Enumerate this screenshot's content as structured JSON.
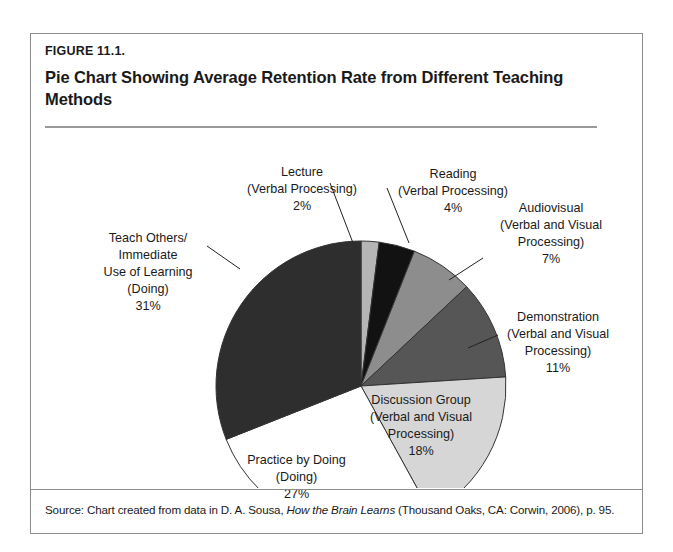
{
  "figure": {
    "label": "FIGURE 11.1.",
    "title": "Pie Chart Showing Average Retention Rate from Different Teaching Methods",
    "source_prefix": "Source: Chart created from data in D. A. Sousa, ",
    "source_book": "How the Brain Learns",
    "source_suffix": " (Thousand Oaks, CA: Corwin, 2006), p. 95."
  },
  "chart_data": {
    "type": "pie",
    "title": "Pie Chart Showing Average Retention Rate from Different Teaching Methods",
    "xlabel": "",
    "ylabel": "",
    "units": "percent",
    "start_angle_deg": 0,
    "direction": "clockwise",
    "categories": [
      "Lecture",
      "Reading",
      "Audiovisual",
      "Demonstration",
      "Discussion Group",
      "Practice by Doing",
      "Teach Others/Immediate Use of Learning"
    ],
    "values": [
      2,
      4,
      7,
      11,
      18,
      27,
      31
    ],
    "slices": [
      {
        "name": "Lecture",
        "processing": "(Verbal Processing)",
        "value": 2,
        "value_label": "2%",
        "color": "#b5b5b5",
        "label_lines": [
          "Lecture",
          "(Verbal Processing)",
          "2%"
        ],
        "label_placement": "outside"
      },
      {
        "name": "Reading",
        "processing": "(Verbal Processing)",
        "value": 4,
        "value_label": "4%",
        "color": "#121212",
        "label_lines": [
          "Reading",
          "(Verbal Processing)",
          "4%"
        ],
        "label_placement": "outside"
      },
      {
        "name": "Audiovisual",
        "processing": "(Verbal and Visual Processing)",
        "value": 7,
        "value_label": "7%",
        "color": "#8d8d8d",
        "label_lines": [
          "Audiovisual",
          "(Verbal and Visual",
          "Processing)",
          "7%"
        ],
        "label_placement": "outside"
      },
      {
        "name": "Demonstration",
        "processing": "(Verbal and Visual Processing)",
        "value": 11,
        "value_label": "11%",
        "color": "#565656",
        "label_lines": [
          "Demonstration",
          "(Verbal and Visual",
          "Processing)",
          "11%"
        ],
        "label_placement": "outside"
      },
      {
        "name": "Discussion Group",
        "processing": "(Verbal and Visual Processing)",
        "value": 18,
        "value_label": "18%",
        "color": "#d6d6d6",
        "label_lines": [
          "Discussion Group",
          "(Verbal and Visual",
          "Processing)",
          "18%"
        ],
        "label_placement": "inside"
      },
      {
        "name": "Practice by Doing",
        "processing": "(Doing)",
        "value": 27,
        "value_label": "27%",
        "color": "#ffffff",
        "label_lines": [
          "Practice by Doing",
          "(Doing)",
          "27%"
        ],
        "label_placement": "inside"
      },
      {
        "name": "Teach Others/Immediate Use of Learning",
        "processing": "(Doing)",
        "value": 31,
        "value_label": "31%",
        "color": "#2e2e2e",
        "label_lines": [
          "Teach Others/",
          "Immediate",
          "Use of Learning",
          "(Doing)",
          "31%"
        ],
        "label_placement": "outside"
      }
    ],
    "geometry": {
      "cx": 330,
      "cy": 256,
      "r": 145,
      "stroke": "#333333"
    },
    "labels": [
      {
        "key": "lecture",
        "x": 196,
        "y": 34,
        "w": 150,
        "align": "center"
      },
      {
        "key": "reading",
        "x": 352,
        "y": 36,
        "w": 140,
        "align": "center"
      },
      {
        "key": "audiovisual",
        "x": 440,
        "y": 70,
        "w": 160,
        "align": "center"
      },
      {
        "key": "demonstration",
        "x": 448,
        "y": 179,
        "w": 158,
        "align": "center"
      },
      {
        "key": "discussion",
        "x": 310,
        "y": 262,
        "w": 160,
        "align": "center"
      },
      {
        "key": "practice",
        "x": 178,
        "y": 322,
        "w": 175,
        "align": "center"
      },
      {
        "key": "teachothers",
        "x": 42,
        "y": 100,
        "w": 150,
        "align": "center"
      }
    ],
    "leaders": [
      {
        "name": "lecture-leader",
        "x1": 299,
        "y1": 53,
        "x2": 322,
        "y2": 113
      },
      {
        "name": "reading-leader",
        "x1": 378,
        "y1": 113,
        "x2": 356,
        "y2": 58
      },
      {
        "name": "audiovisual-leader",
        "x1": 418,
        "y1": 150,
        "x2": 452,
        "y2": 128
      },
      {
        "name": "demonstration-leader",
        "x1": 437,
        "y1": 218,
        "x2": 467,
        "y2": 205
      },
      {
        "name": "teachothers-leader",
        "x1": 209,
        "y1": 139,
        "x2": 176,
        "y2": 116
      }
    ]
  }
}
